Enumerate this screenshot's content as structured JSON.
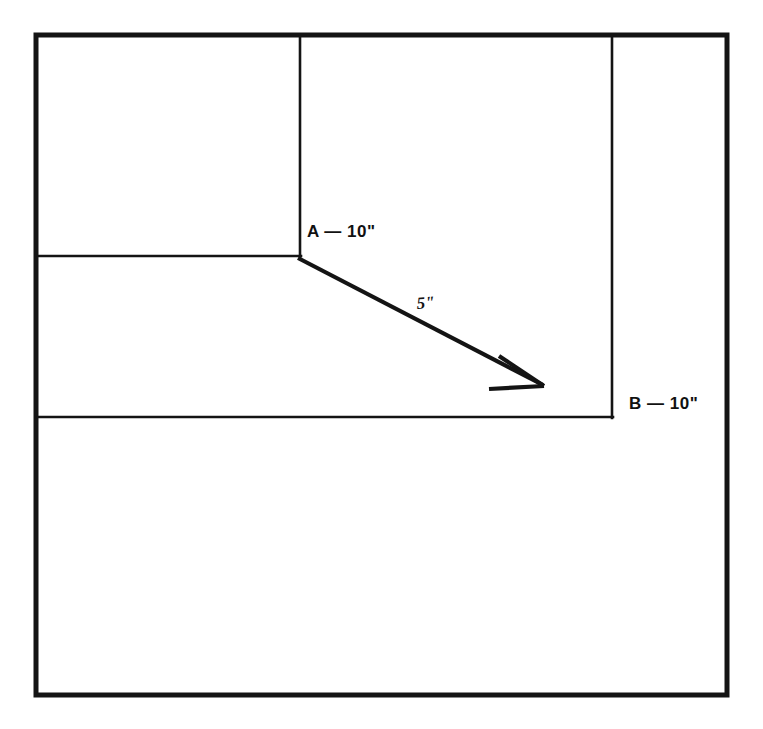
{
  "figure": {
    "type": "technical-line-drawing",
    "background_color": "#ffffff",
    "stroke_color": "#141414",
    "labels": {
      "point_a": "A — 10\"",
      "point_b": "B — 10\"",
      "arrow_length": "5\""
    },
    "outer_frame": {
      "x": 36,
      "y": 35,
      "width": 691,
      "height": 660,
      "stroke_width": 5
    },
    "inner_lines": [
      {
        "name": "vertical-divider-left",
        "x1": 300,
        "y1": 35,
        "x2": 300,
        "y2": 257,
        "stroke_width": 2.5
      },
      {
        "name": "vertical-divider-right",
        "x1": 612,
        "y1": 35,
        "x2": 612,
        "y2": 418,
        "stroke_width": 2.5
      },
      {
        "name": "horizontal-divider-upper",
        "x1": 36,
        "y1": 256,
        "x2": 300,
        "y2": 256,
        "stroke_width": 2.5
      },
      {
        "name": "horizontal-divider-lower",
        "x1": 36,
        "y1": 417,
        "x2": 612,
        "y2": 417,
        "stroke_width": 2.5
      }
    ],
    "arrow": {
      "name": "dimension-arrow",
      "from": [
        298,
        258
      ],
      "to": [
        543,
        385
      ],
      "stroke_width": 4,
      "head_barb_1": [
        498,
        357
      ],
      "head_barb_2": [
        489,
        388
      ]
    }
  }
}
